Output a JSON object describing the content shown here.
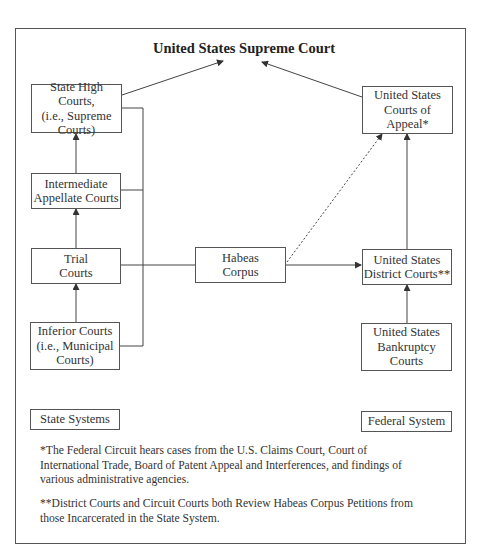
{
  "diagram": {
    "title": "United States Supreme Court",
    "state_boxes": {
      "high": "State High Courts,\n(i.e., Supreme\nCourts)",
      "intermediate": "Intermediate\nAppellate Courts",
      "trial": "Trial\nCourts",
      "inferior": "Inferior Courts\n(i.e., Municipal\nCourts)"
    },
    "habeas": "Habeas\nCorpus",
    "federal_boxes": {
      "appeals": "United States\nCourts of\nAppeal*",
      "district": "United States\nDistrict Courts**",
      "bankruptcy": "United States\nBankruptcy\nCourts"
    },
    "legend": {
      "state": "State Systems",
      "federal": "Federal System"
    },
    "notes": [
      "*The Federal Circuit hears cases from the U.S. Claims Court, Court of International Trade, Board of Patent Appeal and Interferences, and findings of various administrative agencies.",
      "**District Courts and Circuit Courts both Review Habeas Corpus Petitions from those Incarcerated in the State System."
    ]
  }
}
